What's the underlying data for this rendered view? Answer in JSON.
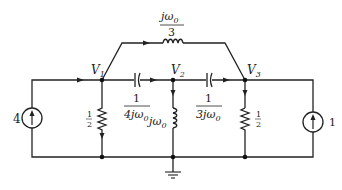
{
  "diagram": {
    "type": "circuit",
    "nodes": {
      "v1": {
        "label": "V",
        "sub": "1"
      },
      "v2": {
        "label": "V",
        "sub": "2"
      },
      "v3": {
        "label": "V",
        "sub": "3"
      }
    },
    "components": {
      "top_inductor": {
        "num": "jω",
        "num_sub": "0",
        "den": "3"
      },
      "cap_12": {
        "num": "1",
        "den": "4jω",
        "den_sub": "0"
      },
      "cap_23": {
        "num": "1",
        "den": "3jω",
        "den_sub": "0"
      },
      "res_1": {
        "label_num": "1",
        "label_den": "2"
      },
      "res_3": {
        "label_num": "1",
        "label_den": "2"
      },
      "ind_2": {
        "label": "jω",
        "label_sub": "0"
      },
      "src_left": {
        "label": "4"
      },
      "src_right": {
        "label": "1"
      }
    },
    "colors": {
      "line": "#222222",
      "background": "#ffffff"
    }
  }
}
